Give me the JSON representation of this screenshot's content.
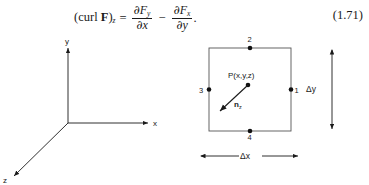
{
  "equation": {
    "lhs_curl": "curl",
    "lhs_vector": "F",
    "lhs_subscript": "z",
    "equals": "=",
    "term1_numerator_partial": "∂",
    "term1_numerator_symbol": "F",
    "term1_numerator_subscript": "y",
    "term1_denominator_partial": "∂",
    "term1_denominator_symbol": "x",
    "operator": "−",
    "term2_numerator_partial": "∂",
    "term2_numerator_symbol": "F",
    "term2_numerator_subscript": "x",
    "term2_denominator_partial": "∂",
    "term2_denominator_symbol": "y",
    "period": ".",
    "number": "(1.71)",
    "plain_text": "(curl F)_z = ∂F_y/∂x − ∂F_x/∂y."
  },
  "axes_figure": {
    "y_axis_label": "y",
    "x_axis_label": "x",
    "z_axis_label": "z"
  },
  "square_figure": {
    "node_1_label": "1",
    "node_2_label": "2",
    "node_3_label": "3",
    "node_4_label": "4",
    "point_label": "P(x,y,z)",
    "normal_vector_label": "n",
    "normal_vector_subscript": "z",
    "width_dimension_label": "Δx",
    "height_dimension_label": "Δy",
    "delta_symbol": "Δ",
    "width_dimension_axis": "x",
    "height_dimension_axis": "y"
  },
  "colors": {
    "ink": "#1a1a1a",
    "background": "#ffffff",
    "rule": "#555555"
  }
}
